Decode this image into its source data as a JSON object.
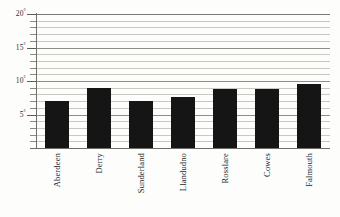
{
  "chart_data": {
    "type": "bar",
    "title": "",
    "subtitle": "",
    "xlabel": "",
    "ylabel": "",
    "categories": [
      "Aberdeen",
      "Derry",
      "Sunderland",
      "Llandudno",
      "Rosslare",
      "Cowes",
      "Falmouth"
    ],
    "values": [
      7.0,
      8.9,
      7.0,
      7.6,
      8.8,
      8.8,
      9.6
    ],
    "series": [
      {
        "name": "Mean temperature",
        "values": [
          7.0,
          8.9,
          7.0,
          7.6,
          8.8,
          8.8,
          9.6
        ]
      }
    ],
    "ylim": [
      0,
      20
    ],
    "xlim": [
      0,
      7
    ],
    "grid": true,
    "grid_axis": "y",
    "grid_minor_step": 1,
    "grid_major_step": 5,
    "legend": false,
    "legend_position": "none",
    "bar_color": "#151515",
    "gridline_color": "#c9c9c4",
    "major_gridline_color": "#8e8e88",
    "axis_color": "#6f6f69",
    "background_color": "#fdfdfc",
    "value_unit": "°",
    "y_tick_values": [
      5,
      10,
      15,
      20
    ],
    "y_tick_labels": [
      "5°",
      "10°",
      "15°",
      "20°"
    ],
    "y_minor_tick_values": [
      1,
      2,
      3,
      4,
      6,
      7,
      8,
      9,
      11,
      12,
      13,
      14,
      16,
      17,
      18,
      19
    ],
    "annotations": []
  },
  "y_axis": {
    "ticks": [
      {
        "value": 20,
        "number": "20",
        "degree": "°"
      },
      {
        "value": 15,
        "number": "15",
        "degree": "°"
      },
      {
        "value": 10,
        "number": "10",
        "degree": "°"
      },
      {
        "value": 5,
        "number": "5",
        "degree": "°"
      }
    ]
  },
  "x_axis": {
    "categories": [
      {
        "label": "Aberdeen"
      },
      {
        "label": "Derry"
      },
      {
        "label": "Sunderland"
      },
      {
        "label": "Llandudno"
      },
      {
        "label": "Rosslare"
      },
      {
        "label": "Cowes"
      },
      {
        "label": "Falmouth"
      }
    ]
  }
}
